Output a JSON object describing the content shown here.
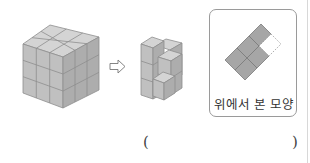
{
  "figure": {
    "big_cube": {
      "layers": 3,
      "rows": 3,
      "cols": 3
    },
    "arrow_icon": "hollow-right-arrow",
    "small_stack": {
      "description": "stack of unit cubes remaining after removal"
    },
    "top_view": {
      "label": "위에서 본 모양",
      "filled_cells": 5,
      "dashed_cells": 1
    },
    "answer": {
      "open_paren": "(",
      "close_paren": ")",
      "value": ""
    }
  },
  "colors": {
    "cube_top": "#d2d2d2",
    "cube_left": "#bdbdbd",
    "cube_right": "#a9a9a9",
    "edge": "#8c8c8c",
    "view_fill": "#a6a6a6",
    "box_border": "#9a9a9a"
  }
}
